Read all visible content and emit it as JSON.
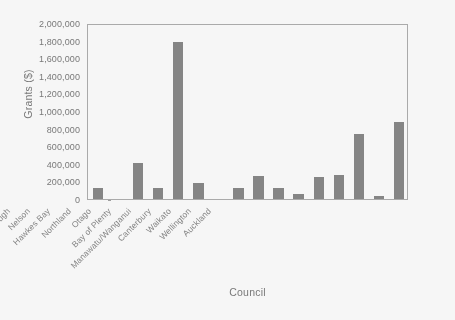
{
  "chart_data": {
    "type": "bar",
    "title": "",
    "xlabel": "Council",
    "ylabel": "Grants ($)",
    "ylim": [
      0,
      2000000
    ],
    "ytick_step": 200000,
    "ytick_labels": [
      "2,000,000",
      "1,800,000",
      "1,600,000",
      "1,400,000",
      "1,200,000",
      "1,000,000",
      "800,000",
      "600,000",
      "400,000",
      "200,000",
      "0"
    ],
    "grid": false,
    "legend": false,
    "bar_color": "#7d7d7d",
    "axis_color": "#a8a8a8",
    "text_color": "#6f6f6f",
    "categories": [
      "Gisborne",
      "West Coast",
      "Southland",
      "Taranaki",
      "Tasman",
      "Marlborough",
      "Nelson",
      "Hawkes Bay",
      "Northland",
      "Otago",
      "Bay of Plenty",
      "Manawatu/Wanganui",
      "Canterbury",
      "Waikato",
      "Wellington",
      "Auckland"
    ],
    "values": [
      130000,
      0,
      410000,
      125000,
      1780000,
      185000,
      0,
      125000,
      265000,
      120000,
      60000,
      245000,
      270000,
      740000,
      30000,
      875000
    ]
  }
}
